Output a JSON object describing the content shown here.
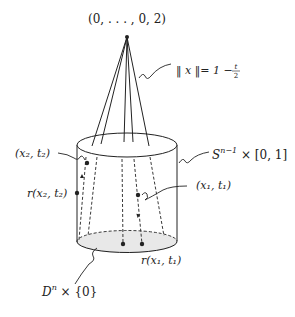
{
  "diagram": {
    "type": "topology-cylinder-cone",
    "labels": {
      "apex": "(0, . . . , 0, 2)",
      "norm_left": "‖ x ‖= 1 − ",
      "norm_frac_num": "t",
      "norm_frac_den": "2",
      "cylinder_S": "S",
      "cylinder_S_sup": "n−1",
      "cylinder_rest": " × [0, 1]",
      "x2t2": "(x₂, t₂)",
      "r_x2t2": "r(x₂, t₂)",
      "x1t1": "(x₁, t₁)",
      "r_x1t1": "r(x₁, t₁)",
      "disk_D": "D",
      "disk_D_sup": "n",
      "disk_rest": " × {0}"
    },
    "colors": {
      "stroke": "#222222",
      "disk_fill": "#e8e8e8",
      "background": "#ffffff"
    }
  }
}
